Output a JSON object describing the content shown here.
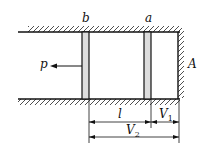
{
  "diagram": {
    "labels": {
      "piston_b": "b",
      "piston_a": "a",
      "wall": "A",
      "pull_force": "p",
      "length_l": "l",
      "dim_v1_main": "V",
      "dim_v1_sub": "1",
      "dim_v2_main": "V",
      "dim_v2_sub": "2"
    }
  }
}
